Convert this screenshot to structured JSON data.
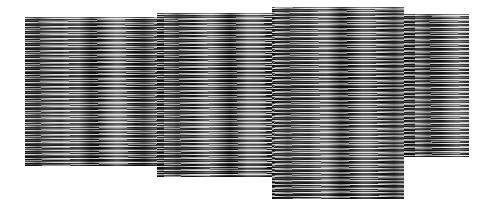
{
  "image": {
    "description": "Four adjacent rectangular panels filled with dense horizontal black, grey and white streak textures on a white background",
    "background_color": "#ffffff",
    "panels": [
      {
        "id": "panel-1",
        "x": 25,
        "y": 17,
        "width": 132,
        "height": 149
      },
      {
        "id": "panel-2",
        "x": 157,
        "y": 13,
        "width": 115,
        "height": 164
      },
      {
        "id": "panel-3",
        "x": 272,
        "y": 7,
        "width": 132,
        "height": 192
      },
      {
        "id": "panel-4",
        "x": 404,
        "y": 14,
        "width": 65,
        "height": 143
      }
    ]
  }
}
